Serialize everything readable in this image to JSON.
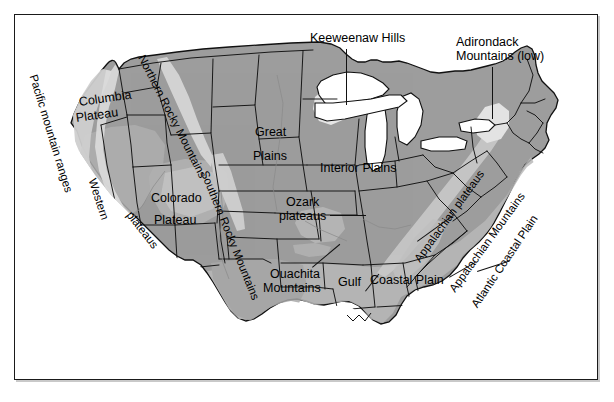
{
  "figure": {
    "type": "physiographic-map",
    "region": "United States (conterminous)",
    "background_color": "#ffffff",
    "frame_color": "#1a1a1a",
    "land_fill": "#9d9d9d",
    "land_fill_light": "#b5b5b5",
    "highland_fill": "#d8d8d8",
    "lake_fill": "#ffffff",
    "outline_color": "#111111"
  },
  "labels": {
    "keeweenaw_hills": "Keeweenaw Hills",
    "adirondack_line1": "Adirondack",
    "adirondack_line2": "Mountains (low)",
    "pacific_mountain_ranges": "Pacific mountain ranges",
    "columbia_line1": "Columbia",
    "columbia_line2": "Plateau",
    "northern_rocky_mountains": "Northern Rocky Mountains",
    "great_line1": "Great",
    "great_line2": "Plains",
    "interior_plains": "Interior Plains",
    "western": "Western",
    "plateaus": "plateaus",
    "colorado": "Colorado",
    "plateau": "Plateau",
    "southern_rocky_mountains": "Southern Rocky Mountains",
    "ozark_line1": "Ozark",
    "ozark_line2": "plateaus",
    "ouachita_line1": "Ouachita",
    "ouachita_line2": "Mountains",
    "gulf": "Gulf",
    "coastal_plain": "Coastal Plain",
    "appalachian_plateaus": "Appalachian plateaus",
    "appalachian_mountains": "Appalachian Mountains",
    "atlantic_coastal_plain": "Atlantic Coastal Plain"
  }
}
